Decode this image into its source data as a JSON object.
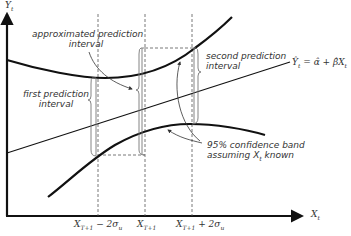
{
  "diagram": {
    "axes": {
      "y_label": "Y",
      "y_sub": "t",
      "x_label": "X",
      "x_sub": "t"
    },
    "tick_labels": [
      {
        "main": "X",
        "sub": "T+1",
        "suffix": " − 2σ",
        "suffix_sub": "u"
      },
      {
        "main": "X",
        "sub": "T+1",
        "suffix": "",
        "suffix_sub": ""
      },
      {
        "main": "X",
        "sub": "T+1",
        "suffix": " + 2σ",
        "suffix_sub": "u"
      }
    ],
    "annotations": {
      "approx_line1": "approximated prediction",
      "approx_line2": "interval",
      "first_line1": "first prediction",
      "first_line2": "interval",
      "second_line1": "second prediction",
      "second_line2": "interval",
      "band_line1": "95% confidence band",
      "band_line2_pre": "assuming ",
      "band_line2_var": "X",
      "band_line2_sub": "t",
      "band_line2_post": " known"
    },
    "equation": "Ŷt = α̂ + β̂Xt",
    "equation_parts": {
      "lhs": "Ŷ",
      "lhs_sub": "t",
      "rhs": " = α̂ + β̂X",
      "rhs_sub": "t"
    },
    "colors": {
      "line": "#111111",
      "dashed": "#555555",
      "bracket": "#777777"
    }
  }
}
